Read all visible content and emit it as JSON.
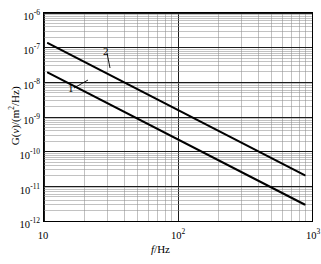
{
  "chart_data": {
    "type": "line",
    "title": "",
    "xlabel": "f/Hz",
    "ylabel": "G(v)/(m2/Hz)",
    "xscale": "log",
    "yscale": "log",
    "xlim": [
      10,
      1000
    ],
    "ylim": [
      1e-12,
      1e-06
    ],
    "grid": true,
    "minor_grid": true,
    "legend": "inline-callout",
    "xticks": [
      {
        "value": 10,
        "mantissa": "10",
        "exponent": ""
      },
      {
        "value": 100,
        "mantissa": "10",
        "exponent": "2"
      },
      {
        "value": 1000,
        "mantissa": "10",
        "exponent": "3"
      }
    ],
    "yticks": [
      {
        "value": 1e-06,
        "mantissa": "10",
        "exponent": "-6"
      },
      {
        "value": 1e-07,
        "mantissa": "10",
        "exponent": "-7"
      },
      {
        "value": 1e-08,
        "mantissa": "10",
        "exponent": "-8"
      },
      {
        "value": 1e-09,
        "mantissa": "10",
        "exponent": "-9"
      },
      {
        "value": 1e-10,
        "mantissa": "10",
        "exponent": "-10"
      },
      {
        "value": 1e-11,
        "mantissa": "10",
        "exponent": "-11"
      },
      {
        "value": 1e-12,
        "mantissa": "10",
        "exponent": "-12"
      }
    ],
    "series": [
      {
        "name": "2",
        "label": "2",
        "color": "#000000",
        "points": [
          [
            10.7,
            1.35e-07
          ],
          [
            880,
            2.1e-11
          ]
        ],
        "slope_decades_per_decade": -1.95
      },
      {
        "name": "1",
        "label": "1",
        "color": "#000000",
        "points": [
          [
            10.7,
            1.9e-08
          ],
          [
            880,
            3e-12
          ]
        ],
        "slope_decades_per_decade": -1.95
      }
    ],
    "annotations": [
      {
        "text": "2",
        "x_px": 103,
        "y_px": 46,
        "leader": {
          "x1": 107,
          "y1": 53,
          "x2": 110,
          "y2": 68
        }
      },
      {
        "text": "1",
        "x_px": 68,
        "y_px": 83,
        "leader": {
          "x1": 74,
          "y1": 88,
          "x2": 88,
          "y2": 80
        }
      }
    ]
  },
  "axes": {
    "x_title_var": "f",
    "x_title_unit": "/Hz",
    "y_title_prefix": "G(",
    "y_title_var": "v",
    "y_title_suffix": ")/(m",
    "y_title_sup": "2",
    "y_title_tail": "/Hz)"
  }
}
